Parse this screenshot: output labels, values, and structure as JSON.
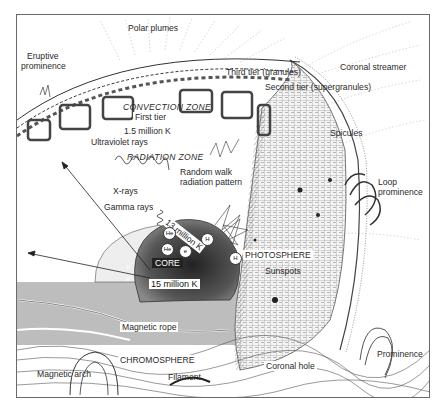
{
  "figure": {
    "labels": {
      "polar_plumes": "Polar plumes",
      "eruptive_prominence_1": "Eruptive",
      "eruptive_prominence_2": "prominence",
      "third_tier": "Third tier (granules)",
      "second_tier": "Second tier (supergranules)",
      "coronal_streamer": "Coronal streamer",
      "convection_zone": "CONVECTION ZONE",
      "first_tier": "First tier",
      "temp_convection": "1.5 million K",
      "spicules": "Spicules",
      "ultraviolet_rays": "Ultraviolet rays",
      "radiation_zone": "RADIATION ZONE",
      "random_walk_1": "Random walk",
      "random_walk_2": "radiation pattern",
      "loop_prominence_1": "Loop",
      "loop_prominence_2": "prominence",
      "x_rays": "X-rays",
      "gamma_rays": "Gamma rays",
      "temp_13": "13 million K",
      "core": "CORE",
      "temp_core": "15 million K",
      "photosphere": "PHOTOSPHERE",
      "sunspots": "Sunspots",
      "magnetic_rope": "Magnetic rope",
      "chromosphere": "CHROMOSPHERE",
      "magnetic_arch": "Magnetic arch",
      "filament": "Filament",
      "coronal_hole": "Coronal hole",
      "prominence": "Prominence"
    },
    "core_particles": [
      "He",
      "H",
      "He",
      "H",
      "e"
    ],
    "neutrino_symbol": "ν"
  }
}
